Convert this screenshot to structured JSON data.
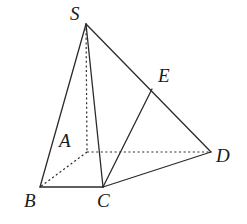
{
  "figure": {
    "type": "geometry-diagram",
    "canvas": {
      "width": 247,
      "height": 224
    },
    "background_color": "#ffffff",
    "stroke_color": "#2b2b2b",
    "label_color": "#1a1a1a",
    "solid_stroke_width": 1.3,
    "dashed_stroke_width": 1.2,
    "dash_pattern": "2,2.6",
    "vertices": [
      {
        "id": "S",
        "label": "S",
        "x": 86,
        "y": 24,
        "label_x": 70,
        "label_y": 4,
        "font_size": 19,
        "hidden": false
      },
      {
        "id": "E",
        "label": "E",
        "x": 152,
        "y": 89,
        "label_x": 158,
        "label_y": 66,
        "font_size": 19,
        "hidden": false
      },
      {
        "id": "D",
        "label": "D",
        "x": 211,
        "y": 152,
        "label_x": 216,
        "label_y": 146,
        "font_size": 19,
        "hidden": false
      },
      {
        "id": "A",
        "label": "A",
        "x": 87,
        "y": 152,
        "label_x": 59,
        "label_y": 131,
        "font_size": 19,
        "hidden": true
      },
      {
        "id": "C",
        "label": "C",
        "x": 103,
        "y": 187,
        "label_x": 97,
        "label_y": 191,
        "font_size": 19,
        "hidden": false
      },
      {
        "id": "B",
        "label": "B",
        "x": 40,
        "y": 187,
        "label_x": 24,
        "label_y": 191,
        "font_size": 19,
        "hidden": false
      }
    ],
    "edges": [
      {
        "id": "SB",
        "from": "S",
        "to": "B",
        "style": "solid"
      },
      {
        "id": "SC",
        "from": "S",
        "to": "C",
        "style": "solid"
      },
      {
        "id": "SD",
        "from": "S",
        "to": "D",
        "style": "solid"
      },
      {
        "id": "CE",
        "from": "C",
        "to": "E",
        "style": "solid"
      },
      {
        "id": "CD",
        "from": "C",
        "to": "D",
        "style": "solid"
      },
      {
        "id": "BC",
        "from": "B",
        "to": "C",
        "style": "solid"
      },
      {
        "id": "SA",
        "from": "S",
        "to": "A",
        "style": "dashed"
      },
      {
        "id": "AD",
        "from": "A",
        "to": "D",
        "style": "dashed"
      },
      {
        "id": "AB",
        "from": "A",
        "to": "B",
        "style": "dashed"
      }
    ]
  }
}
